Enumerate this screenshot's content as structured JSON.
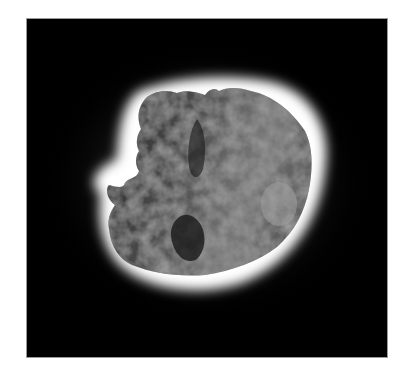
{
  "image": {
    "subject": "comet nucleus with bright coma halo",
    "background_color": "#ffffff",
    "frame_color": "#000000",
    "halo_color": "#ffffff",
    "nucleus_tone": "#5a5a5a"
  }
}
